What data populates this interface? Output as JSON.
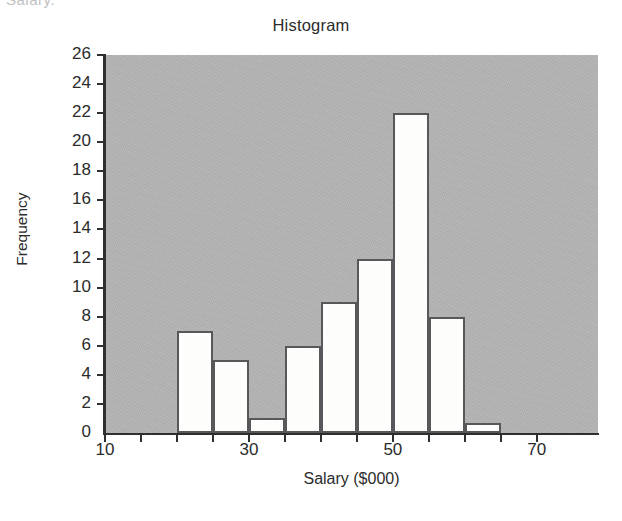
{
  "page": {
    "top_fragment": "Salary."
  },
  "chart_data": {
    "type": "bar",
    "title": "Histogram",
    "xlabel": "Salary ($000)",
    "ylabel": "Frequency",
    "xlim": [
      10,
      78.5
    ],
    "ylim": [
      0,
      26
    ],
    "grid": false,
    "legend": null,
    "bin_width": 5,
    "x_tick_labels": [
      "10",
      "30",
      "50",
      "70"
    ],
    "x_tick_values": [
      10,
      30,
      50,
      70
    ],
    "x_minor_tick_values": [
      15,
      20,
      25,
      35,
      40,
      45,
      55,
      60,
      65
    ],
    "y_tick_labels": [
      "0",
      "2",
      "4",
      "6",
      "8",
      "10",
      "12",
      "14",
      "16",
      "18",
      "20",
      "22",
      "24",
      "26"
    ],
    "y_tick_values": [
      0,
      2,
      4,
      6,
      8,
      10,
      12,
      14,
      16,
      18,
      20,
      22,
      24,
      26
    ],
    "bins": [
      {
        "start": 20,
        "end": 25,
        "value": 7
      },
      {
        "start": 25,
        "end": 30,
        "value": 5
      },
      {
        "start": 30,
        "end": 35,
        "value": 1
      },
      {
        "start": 35,
        "end": 40,
        "value": 6
      },
      {
        "start": 40,
        "end": 45,
        "value": 9
      },
      {
        "start": 45,
        "end": 50,
        "value": 12
      },
      {
        "start": 50,
        "end": 55,
        "value": 22
      },
      {
        "start": 55,
        "end": 60,
        "value": 8
      },
      {
        "start": 60,
        "end": 65,
        "value": 0.7
      }
    ],
    "categories": [
      "20-25",
      "25-30",
      "30-35",
      "35-40",
      "40-45",
      "45-50",
      "50-55",
      "55-60",
      "60-65"
    ],
    "values": [
      7,
      5,
      1,
      6,
      9,
      12,
      22,
      8,
      0.7
    ],
    "colors": {
      "plot_background": "#b4b4b4",
      "bar_fill": "#fdfdfc",
      "bar_outline": "#58585a",
      "axis": "#2f2f2f",
      "text": "#2b2b2b",
      "page_background": "#ffffff"
    }
  }
}
